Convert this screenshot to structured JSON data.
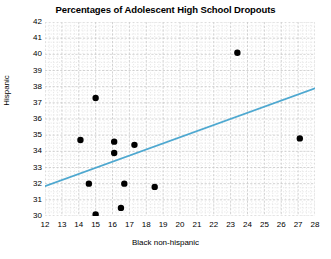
{
  "chart_data": {
    "type": "scatter",
    "title": "Percentages of Adolescent High School Dropouts",
    "xlabel": "Black non-hispanic",
    "ylabel": "Hispanic",
    "xlim": [
      12,
      28
    ],
    "ylim": [
      30,
      42
    ],
    "xticks": [
      12,
      13,
      14,
      15,
      16,
      17,
      18,
      19,
      20,
      21,
      22,
      23,
      24,
      25,
      26,
      27,
      28
    ],
    "yticks": [
      30,
      31,
      32,
      33,
      34,
      35,
      36,
      37,
      38,
      39,
      40,
      41,
      42
    ],
    "grid": true,
    "grid_color": "#c8c8c8",
    "minor_grid": true,
    "legend": null,
    "point_color": "#000000",
    "point_radius": 3.2,
    "points": [
      {
        "x": 14.1,
        "y": 34.7
      },
      {
        "x": 14.6,
        "y": 32.0
      },
      {
        "x": 15.0,
        "y": 37.3
      },
      {
        "x": 15.0,
        "y": 30.1
      },
      {
        "x": 16.1,
        "y": 34.6
      },
      {
        "x": 16.1,
        "y": 33.9
      },
      {
        "x": 16.5,
        "y": 30.5
      },
      {
        "x": 16.7,
        "y": 32.0
      },
      {
        "x": 17.3,
        "y": 34.4
      },
      {
        "x": 18.5,
        "y": 31.8
      },
      {
        "x": 23.4,
        "y": 40.1
      },
      {
        "x": 27.1,
        "y": 34.8
      }
    ],
    "trendline": {
      "color": "#4ea8d0",
      "width": 1.8,
      "x0": 12.0,
      "y0": 31.85,
      "x1": 28.0,
      "y1": 37.9
    }
  }
}
